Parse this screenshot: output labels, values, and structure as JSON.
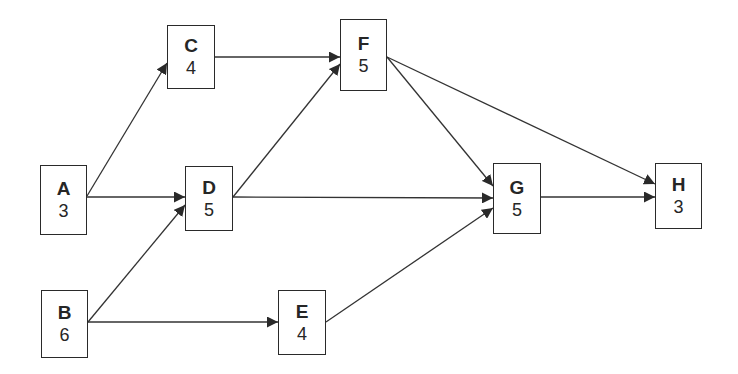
{
  "diagram": {
    "type": "activity-on-node network",
    "colors": {
      "line": "#333333",
      "border": "#2a2a2a",
      "text": "#262626",
      "background": "#ffffff"
    },
    "nodes": [
      {
        "id": "A",
        "label": "A",
        "duration": "3",
        "x": 40,
        "y": 165,
        "w": 47,
        "h": 70
      },
      {
        "id": "B",
        "label": "B",
        "duration": "6",
        "x": 41,
        "y": 290,
        "w": 47,
        "h": 68
      },
      {
        "id": "C",
        "label": "C",
        "duration": "4",
        "x": 167,
        "y": 25,
        "w": 48,
        "h": 64
      },
      {
        "id": "D",
        "label": "D",
        "duration": "5",
        "x": 185,
        "y": 166,
        "w": 48,
        "h": 65
      },
      {
        "id": "E",
        "label": "E",
        "duration": "4",
        "x": 278,
        "y": 290,
        "w": 48,
        "h": 65
      },
      {
        "id": "F",
        "label": "F",
        "duration": "5",
        "x": 340,
        "y": 19,
        "w": 47,
        "h": 72
      },
      {
        "id": "G",
        "label": "G",
        "duration": "5",
        "x": 493,
        "y": 163,
        "w": 48,
        "h": 71
      },
      {
        "id": "H",
        "label": "H",
        "duration": "3",
        "x": 655,
        "y": 163,
        "w": 47,
        "h": 66
      }
    ],
    "edges": [
      {
        "from": "A",
        "to": "C",
        "x1": 87,
        "y1": 196,
        "x2": 167,
        "y2": 63
      },
      {
        "from": "A",
        "to": "D",
        "x1": 87,
        "y1": 197,
        "x2": 185,
        "y2": 197
      },
      {
        "from": "B",
        "to": "D",
        "x1": 88,
        "y1": 322,
        "x2": 185,
        "y2": 205
      },
      {
        "from": "B",
        "to": "E",
        "x1": 88,
        "y1": 322,
        "x2": 278,
        "y2": 322
      },
      {
        "from": "C",
        "to": "F",
        "x1": 215,
        "y1": 57,
        "x2": 340,
        "y2": 57
      },
      {
        "from": "D",
        "to": "F",
        "x1": 233,
        "y1": 197,
        "x2": 340,
        "y2": 64
      },
      {
        "from": "D",
        "to": "G",
        "x1": 233,
        "y1": 197,
        "x2": 493,
        "y2": 198
      },
      {
        "from": "E",
        "to": "G",
        "x1": 326,
        "y1": 322,
        "x2": 493,
        "y2": 208
      },
      {
        "from": "F",
        "to": "G",
        "x1": 387,
        "y1": 57,
        "x2": 493,
        "y2": 186
      },
      {
        "from": "F",
        "to": "H",
        "x1": 387,
        "y1": 57,
        "x2": 655,
        "y2": 184
      },
      {
        "from": "G",
        "to": "H",
        "x1": 541,
        "y1": 197,
        "x2": 655,
        "y2": 197
      }
    ]
  }
}
